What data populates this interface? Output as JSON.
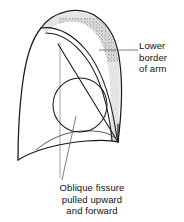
{
  "figure": {
    "name": "lung-oblique-fissure-diagram",
    "type": "anatomical-line-drawing",
    "view": "lateral view of lung with displaced oblique fissure",
    "background_color": "#ffffff",
    "stroke_color": "#1a1a1a",
    "leader_line_color": "#6e6e6e",
    "band_fill_color": "#e3e3e3",
    "stipple_color": "#7a7a7a"
  },
  "labels": {
    "lower_border": {
      "lines": [
        "Lower",
        "border",
        "of arm"
      ],
      "line1": "Lower",
      "line2": "border",
      "line3": "of arm",
      "anchor": "right"
    },
    "oblique_fissure": {
      "lines": [
        "Oblique fissure",
        "pulled upward",
        "and forward"
      ],
      "line1": "Oblique fissure",
      "line2": "pulled upward",
      "line3": "and forward",
      "anchor": "center"
    }
  },
  "shapes": {
    "lung_outline": {
      "name": "lung-outline",
      "description": "outer lung silhouette, apex top, angled posterior border"
    },
    "shaded_band": {
      "name": "oblique-fissure-band",
      "description": "grey shaded band running from upper-left apex region down to lower-right costophrenic angle"
    },
    "stipple_patch": {
      "name": "stipple-patch",
      "description": "dotted/stippled area at the upper portion of the shaded band"
    },
    "circle_marker": {
      "name": "circle-marker",
      "description": "circle overlapping mid-lower lung field",
      "cx": 80,
      "cy": 105,
      "r": 27
    },
    "vertical_guide": {
      "name": "vertical-guide-line",
      "description": "thin vertical grey guide line through the lung"
    }
  },
  "leaders": {
    "lower_border_leader": {
      "name": "lower-border-leader-line",
      "from_x": 100,
      "from_y": 50,
      "to_x": 138,
      "to_y": 50
    },
    "oblique_fissure_leader": {
      "name": "oblique-fissure-leader-line",
      "from_x": 74,
      "from_y": 118,
      "to_x": 62,
      "to_y": 180
    }
  }
}
